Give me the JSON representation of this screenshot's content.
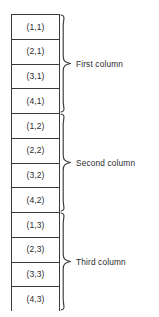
{
  "diagram": {
    "type": "column-major-array-layout",
    "background_color": "#ffffff",
    "line_color": "#3a3a3a",
    "text_color": "#2b2b2b",
    "cells": [
      {
        "label": "(1,1)"
      },
      {
        "label": "(2,1)"
      },
      {
        "label": "(3,1)"
      },
      {
        "label": "(4,1)"
      },
      {
        "label": "(1,2)"
      },
      {
        "label": "(2,2)"
      },
      {
        "label": "(3,2)"
      },
      {
        "label": "(4,2)"
      },
      {
        "label": "(1,3)"
      },
      {
        "label": "(2,3)"
      },
      {
        "label": "(3,3)"
      },
      {
        "label": "(4,3)"
      }
    ],
    "groups": [
      {
        "label": "First column",
        "cell_count": 4,
        "start_index": 0
      },
      {
        "label": "Second column",
        "cell_count": 4,
        "start_index": 4
      },
      {
        "label": "Third column",
        "cell_count": 4,
        "start_index": 8
      }
    ]
  }
}
